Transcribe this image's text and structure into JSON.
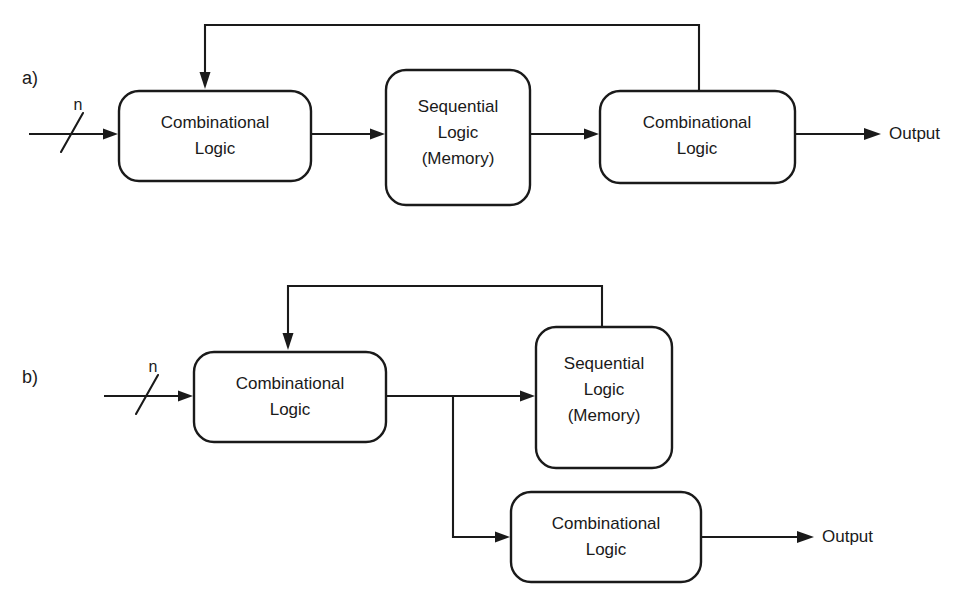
{
  "figure": {
    "background_color": "#ffffff",
    "line_color": "#1a1a1a",
    "panels": [
      {
        "id": "panel-a",
        "label": "a)",
        "description": "Mealy-style sequential circuit: input combinational logic, sequential logic (memory), output combinational logic in a chain with feedback from the output stage back to the first stage.",
        "input_bus_label": "n",
        "output_label": "Output",
        "blocks": [
          {
            "id": "a-comb-1",
            "line1": "Combinational",
            "line2": "Logic",
            "line3": ""
          },
          {
            "id": "a-seq",
            "line1": "Sequential",
            "line2": "Logic",
            "line3": "(Memory)"
          },
          {
            "id": "a-comb-2",
            "line1": "Combinational",
            "line2": "Logic",
            "line3": ""
          }
        ]
      },
      {
        "id": "panel-b",
        "label": "b)",
        "description": "Moore-style sequential circuit: input combinational logic feeds sequential logic (memory) and, via a branch, a separate output combinational logic block; feedback runs from the sequential logic back to the first combinational block.",
        "input_bus_label": "n",
        "output_label": "Output",
        "blocks": [
          {
            "id": "b-comb-1",
            "line1": "Combinational",
            "line2": "Logic",
            "line3": ""
          },
          {
            "id": "b-seq",
            "line1": "Sequential",
            "line2": "Logic",
            "line3": "(Memory)"
          },
          {
            "id": "b-comb-2",
            "line1": "Combinational",
            "line2": "Logic",
            "line3": ""
          }
        ]
      }
    ]
  }
}
